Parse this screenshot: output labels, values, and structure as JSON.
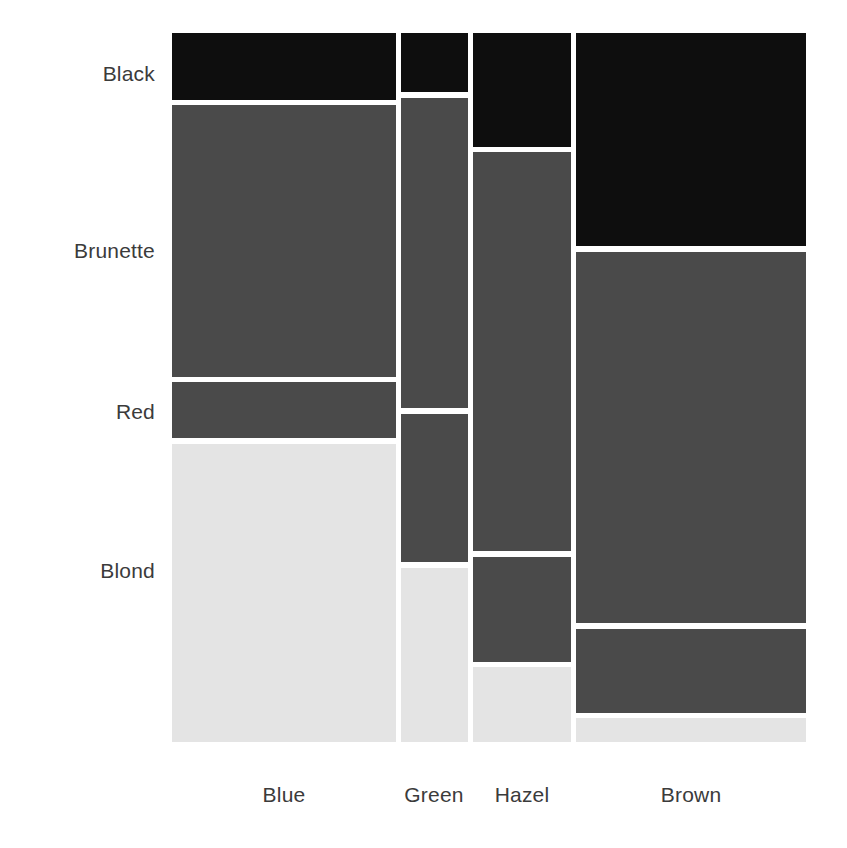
{
  "chart_data": {
    "type": "heatmap",
    "subtype": "mosaic",
    "title": "",
    "subtitle": "",
    "xlabel": "",
    "ylabel": "",
    "grid": false,
    "legend": "none",
    "x_categories": [
      "Blue",
      "Green",
      "Hazel",
      "Brown"
    ],
    "y_categories": [
      "Black",
      "Brunette",
      "Red",
      "Blond"
    ],
    "counts": {
      "Blue": {
        "Black": 20,
        "Brunette": 84,
        "Red": 17,
        "Blond": 94
      },
      "Green": {
        "Black": 5,
        "Brunette": 29,
        "Red": 14,
        "Blond": 16
      },
      "Hazel": {
        "Black": 15,
        "Brunette": 54,
        "Red": 14,
        "Blond": 10
      },
      "Brown": {
        "Black": 68,
        "Brunette": 119,
        "Red": 26,
        "Blond": 7
      }
    },
    "column_totals": {
      "Blue": 215,
      "Green": 64,
      "Hazel": 93,
      "Brown": 220
    },
    "grand_total": 592,
    "row_fill_colors": {
      "Black": "#0e0e0e",
      "Brunette": "#4a4a4a",
      "Red": "#4a4a4a",
      "Blond": "#e4e4e4"
    },
    "gap_color": "#ffffff",
    "geometry": {
      "plot_left": 172,
      "plot_right": 806,
      "plot_top": 33,
      "plot_bottom": 742,
      "columns": [
        {
          "name": "Blue",
          "x": 172,
          "width": 224
        },
        {
          "name": "Green",
          "x": 401,
          "width": 67
        },
        {
          "name": "Hazel",
          "x": 473,
          "width": 98
        },
        {
          "name": "Brown",
          "x": 576,
          "width": 230
        }
      ],
      "tiles": [
        {
          "col": "Blue",
          "row": "Black",
          "x": 172,
          "y": 33,
          "w": 224,
          "h": 67
        },
        {
          "col": "Blue",
          "row": "Brunette",
          "x": 172,
          "y": 105,
          "w": 224,
          "h": 272
        },
        {
          "col": "Blue",
          "row": "Red",
          "x": 172,
          "y": 382,
          "w": 224,
          "h": 56
        },
        {
          "col": "Blue",
          "row": "Blond",
          "x": 172,
          "y": 444,
          "w": 224,
          "h": 298
        },
        {
          "col": "Green",
          "row": "Black",
          "x": 401,
          "y": 33,
          "w": 67,
          "h": 59
        },
        {
          "col": "Green",
          "row": "Brunette",
          "x": 401,
          "y": 98,
          "w": 67,
          "h": 310
        },
        {
          "col": "Green",
          "row": "Red",
          "x": 401,
          "y": 414,
          "w": 67,
          "h": 148
        },
        {
          "col": "Green",
          "row": "Blond",
          "x": 401,
          "y": 568,
          "w": 67,
          "h": 174
        },
        {
          "col": "Hazel",
          "row": "Black",
          "x": 473,
          "y": 33,
          "w": 98,
          "h": 114
        },
        {
          "col": "Hazel",
          "row": "Brunette",
          "x": 473,
          "y": 152,
          "w": 98,
          "h": 399
        },
        {
          "col": "Hazel",
          "row": "Red",
          "x": 473,
          "y": 557,
          "w": 98,
          "h": 105
        },
        {
          "col": "Hazel",
          "row": "Blond",
          "x": 473,
          "y": 667,
          "w": 98,
          "h": 75
        },
        {
          "col": "Brown",
          "row": "Black",
          "x": 576,
          "y": 33,
          "w": 230,
          "h": 213
        },
        {
          "col": "Brown",
          "row": "Brunette",
          "x": 576,
          "y": 252,
          "w": 230,
          "h": 371
        },
        {
          "col": "Brown",
          "row": "Red",
          "x": 576,
          "y": 629,
          "w": 230,
          "h": 84
        },
        {
          "col": "Brown",
          "row": "Blond",
          "x": 576,
          "y": 718,
          "w": 230,
          "h": 24
        }
      ],
      "y_label_positions": [
        {
          "label": "Black",
          "right": 155,
          "center_y": 75
        },
        {
          "label": "Brunette",
          "right": 155,
          "center_y": 252
        },
        {
          "label": "Red",
          "right": 155,
          "center_y": 413
        },
        {
          "label": "Blond",
          "right": 155,
          "center_y": 572
        }
      ],
      "x_label_positions": [
        {
          "label": "Blue",
          "center_x": 284,
          "top": 783
        },
        {
          "label": "Green",
          "center_x": 434,
          "top": 783
        },
        {
          "label": "Hazel",
          "center_x": 522,
          "top": 783
        },
        {
          "label": "Brown",
          "center_x": 691,
          "top": 783
        }
      ]
    }
  }
}
